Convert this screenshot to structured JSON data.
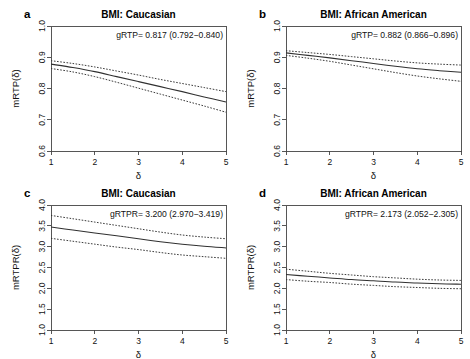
{
  "figure": {
    "background": "#ffffff",
    "line_color": "#303030",
    "axis_color": "#444444"
  },
  "chart_data": [
    {
      "id": "a",
      "type": "line",
      "panel_letter": "a",
      "title": "BMI:  Caucasian",
      "xlabel": "δ",
      "ylabel": "mRTP(δ)",
      "annotation": "gRTP= 0.817 (0.792−0.840)",
      "xlim": [
        1,
        5
      ],
      "ylim": [
        0.6,
        1.0
      ],
      "xticks": [
        1,
        2,
        3,
        4,
        5
      ],
      "xticklabels": [
        "1",
        "2",
        "3",
        "4",
        "5"
      ],
      "yticks": [
        0.6,
        0.7,
        0.8,
        0.9,
        1.0
      ],
      "yticklabels": [
        "0.6",
        "0.7",
        "0.8",
        "0.9",
        "1.0"
      ],
      "grid": false,
      "legend": "none",
      "x": [
        1.0,
        1.5,
        2.0,
        2.5,
        3.0,
        3.5,
        4.0,
        4.5,
        5.0
      ],
      "series": [
        {
          "name": "estimate",
          "style": "solid",
          "values": [
            0.878,
            0.867,
            0.854,
            0.838,
            0.822,
            0.806,
            0.79,
            0.773,
            0.757
          ]
        },
        {
          "name": "upper-95ci",
          "style": "dashed",
          "values": [
            0.889,
            0.88,
            0.869,
            0.856,
            0.843,
            0.829,
            0.816,
            0.803,
            0.79
          ]
        },
        {
          "name": "lower-95ci",
          "style": "dashed",
          "values": [
            0.864,
            0.853,
            0.838,
            0.82,
            0.801,
            0.782,
            0.763,
            0.744,
            0.724
          ]
        }
      ]
    },
    {
      "id": "b",
      "type": "line",
      "panel_letter": "b",
      "title": "BMI: African American",
      "xlabel": "δ",
      "ylabel": "mRTP(δ)",
      "annotation": "gRTP= 0.882 (0.866−0.896)",
      "xlim": [
        1,
        5
      ],
      "ylim": [
        0.6,
        1.0
      ],
      "xticks": [
        1,
        2,
        3,
        4,
        5
      ],
      "xticklabels": [
        "1",
        "2",
        "3",
        "4",
        "5"
      ],
      "yticks": [
        0.6,
        0.7,
        0.8,
        0.9,
        1.0
      ],
      "yticklabels": [
        "0.6",
        "0.7",
        "0.8",
        "0.9",
        "1.0"
      ],
      "grid": false,
      "legend": "none",
      "x": [
        1.0,
        1.5,
        2.0,
        2.5,
        3.0,
        3.5,
        4.0,
        4.5,
        5.0
      ],
      "series": [
        {
          "name": "estimate",
          "style": "solid",
          "values": [
            0.914,
            0.906,
            0.898,
            0.889,
            0.88,
            0.871,
            0.863,
            0.857,
            0.852
          ]
        },
        {
          "name": "upper-95ci",
          "style": "dashed",
          "values": [
            0.921,
            0.915,
            0.909,
            0.902,
            0.895,
            0.888,
            0.882,
            0.878,
            0.875
          ]
        },
        {
          "name": "lower-95ci",
          "style": "dashed",
          "values": [
            0.906,
            0.897,
            0.887,
            0.875,
            0.863,
            0.851,
            0.84,
            0.831,
            0.823
          ]
        }
      ]
    },
    {
      "id": "c",
      "type": "line",
      "panel_letter": "c",
      "title": "BMI:  Caucasian",
      "xlabel": "δ",
      "ylabel": "mRTPR(δ)",
      "annotation": "gRTPR=  3.200 (2.970−3.419)",
      "xlim": [
        1,
        5
      ],
      "ylim": [
        1.0,
        4.0
      ],
      "xticks": [
        1,
        2,
        3,
        4,
        5
      ],
      "xticklabels": [
        "1",
        "2",
        "3",
        "4",
        "5"
      ],
      "yticks": [
        1.0,
        1.5,
        2.0,
        2.5,
        3.0,
        3.5,
        4.0
      ],
      "yticklabels": [
        "1.0",
        "1.5",
        "2.0",
        "2.5",
        "3.0",
        "3.5",
        "4.0"
      ],
      "grid": false,
      "legend": "none",
      "x": [
        1.0,
        1.5,
        2.0,
        2.5,
        3.0,
        3.5,
        4.0,
        4.5,
        5.0
      ],
      "series": [
        {
          "name": "estimate",
          "style": "solid",
          "values": [
            3.47,
            3.4,
            3.33,
            3.26,
            3.19,
            3.12,
            3.06,
            3.01,
            2.97
          ]
        },
        {
          "name": "upper-95ci",
          "style": "dashed",
          "values": [
            3.75,
            3.67,
            3.59,
            3.51,
            3.43,
            3.35,
            3.28,
            3.23,
            3.19
          ]
        },
        {
          "name": "lower-95ci",
          "style": "dashed",
          "values": [
            3.2,
            3.13,
            3.06,
            2.99,
            2.93,
            2.86,
            2.8,
            2.76,
            2.72
          ]
        }
      ]
    },
    {
      "id": "d",
      "type": "line",
      "panel_letter": "d",
      "title": "BMI: African American",
      "xlabel": "δ",
      "ylabel": "mRTPR(δ)",
      "annotation": "gRTPR=  2.173 (2.052−2.305)",
      "xlim": [
        1,
        5
      ],
      "ylim": [
        1.0,
        4.0
      ],
      "xticks": [
        1,
        2,
        3,
        4,
        5
      ],
      "xticklabels": [
        "1",
        "2",
        "3",
        "4",
        "5"
      ],
      "yticks": [
        1.0,
        1.5,
        2.0,
        2.5,
        3.0,
        3.5,
        4.0
      ],
      "yticklabels": [
        "1.0",
        "1.5",
        "2.0",
        "2.5",
        "3.0",
        "3.5",
        "4.0"
      ],
      "grid": false,
      "legend": "none",
      "x": [
        1.0,
        1.5,
        2.0,
        2.5,
        3.0,
        3.5,
        4.0,
        4.5,
        5.0
      ],
      "series": [
        {
          "name": "estimate",
          "style": "solid",
          "values": [
            2.33,
            2.29,
            2.25,
            2.21,
            2.18,
            2.15,
            2.13,
            2.11,
            2.1
          ]
        },
        {
          "name": "upper-95ci",
          "style": "dashed",
          "values": [
            2.46,
            2.41,
            2.36,
            2.32,
            2.28,
            2.25,
            2.22,
            2.2,
            2.19
          ]
        },
        {
          "name": "lower-95ci",
          "style": "dashed",
          "values": [
            2.21,
            2.17,
            2.14,
            2.1,
            2.07,
            2.04,
            2.02,
            2.0,
            1.99
          ]
        }
      ]
    }
  ]
}
